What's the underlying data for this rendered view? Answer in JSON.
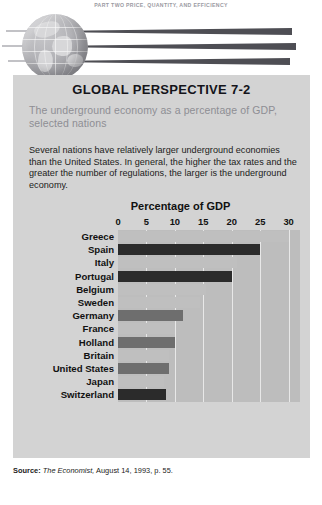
{
  "running_head": "PART TWO   PRICE, QUANTITY, AND EFFICIENCY",
  "banner": {
    "globe_icon": "globe-icon",
    "swoosh_icon": "speed-lines-icon"
  },
  "box": {
    "title": "GLOBAL PERSPECTIVE 7-2",
    "subtitle": "The underground economy as a percentage of GDP, selected nations",
    "body": "Several nations have relatively larger underground economies than the United States. In general, the higher the tax rates and the greater the number of regulations, the larger is the underground economy."
  },
  "source": {
    "label": "Source:",
    "publication": "The Economist,",
    "rest": " August 14, 1993, p. 55."
  },
  "colors": {
    "panel": "#d3d3d3",
    "plot": "#bdbdbd",
    "grid": "#e8e8e8",
    "bar_light": "#bfbfbf",
    "bar_dark": "#2b2b2b",
    "bar_mid": "#6e6e6e",
    "text": "#111111",
    "subtitle": "#8e8e93"
  },
  "chart_data": {
    "type": "bar",
    "orientation": "horizontal",
    "title": "Percentage of GDP",
    "xlabel": "Percentage of GDP",
    "ylabel": "",
    "xlim": [
      0,
      32
    ],
    "ticks": [
      0,
      5,
      10,
      15,
      20,
      25,
      30
    ],
    "grid": true,
    "legend": "none",
    "categories": [
      "Greece",
      "Spain",
      "Italy",
      "Portugal",
      "Belgium",
      "Sweden",
      "Germany",
      "France",
      "Holland",
      "Britain",
      "United States",
      "Japan",
      "Switzerland"
    ],
    "values": [
      30,
      25,
      21,
      20,
      15.5,
      14.5,
      11.5,
      10,
      10,
      9,
      9,
      8,
      8.5
    ],
    "bar_shades": [
      "light",
      "dark",
      "light",
      "dark",
      "light",
      "light",
      "mid",
      "light",
      "mid",
      "light",
      "mid",
      "light",
      "dark"
    ]
  }
}
